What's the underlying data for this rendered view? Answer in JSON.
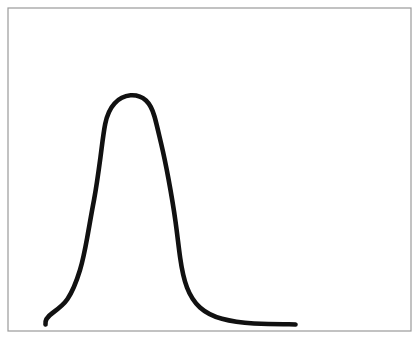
{
  "figure": {
    "title": "",
    "background_color": "#ffffff",
    "width": 418,
    "height": 340,
    "frame": {
      "name": "plot-frame-border",
      "x": 8,
      "y": 8,
      "width": 403,
      "height": 323,
      "stroke_color": "#9a9a9a",
      "stroke_width": 1.2,
      "fill_color": "#ffffff"
    },
    "curve": {
      "name": "hand-drawn-distribution-curve",
      "stroke_color": "#111111",
      "stroke_width": 4.6,
      "style": "hand-drawn",
      "path": "M 45.5 324.5 C 45.0 321.0 47.5 316.5 52.5 313.0 C 58.0 309.0 63.5 305.0 67.5 299.0 C 72.5 291.5 76.5 281.5 80.0 270.0 C 83.5 258.5 85.5 247.0 87.5 236.0 C 89.5 225.0 91.5 213.0 94.0 200.0 C 96.5 186.5 98.5 172.0 100.5 157.0 C 102.2 144.0 103.4 133.0 105.2 124.0 C 107.0 115.0 110.0 108.5 114.5 103.5 C 119.0 98.5 124.5 95.8 130.5 95.3 C 136.5 94.9 142.0 96.8 146.0 100.5 C 150.0 104.2 152.5 109.5 154.5 116.5 C 156.5 123.5 158.5 132.5 161.0 143.0 C 163.5 153.5 166.0 165.5 168.5 179.0 C 171.0 192.5 173.5 207.0 175.5 221.5 C 177.3 234.5 178.6 246.5 180.2 258.0 C 181.8 269.5 183.8 279.0 187.0 287.5 C 190.2 296.0 194.5 302.5 200.0 307.5 C 206.0 312.9 213.5 316.5 222.0 318.8 C 231.5 321.4 242.5 322.8 254.0 323.5 C 265.5 324.2 277.5 324.4 289.0 324.3 C 292.0 324.3 294.0 324.4 295.5 324.5"
    },
    "curve_shape": {
      "description": "unimodal right-skewed peak with long flat right tail and short rising left tail",
      "peak_x": 133,
      "peak_y": 96,
      "left_tail_start_x": 45,
      "left_tail_start_y": 324,
      "right_tail_end_x": 295,
      "right_tail_end_y": 324
    }
  },
  "chart_data": {
    "type": "line",
    "title": "",
    "subtitle": "",
    "xlabel": "",
    "ylabel": "",
    "grid": false,
    "legend": null,
    "axis_ticks": [],
    "tick_labels": [],
    "annotations": [],
    "series": [
      {
        "name": "hand-drawn curve",
        "color": "#111111",
        "x": [
          45,
          52,
          60,
          68,
          76,
          84,
          92,
          100,
          106,
          112,
          120,
          128,
          133,
          140,
          147,
          153,
          159,
          165,
          171,
          177,
          182,
          187,
          194,
          202,
          212,
          224,
          238,
          254,
          270,
          285,
          295
        ],
        "y": [
          324,
          313,
          308,
          298,
          284,
          265,
          246,
          224,
          200,
          172,
          140,
          112,
          96,
          96,
          101,
          113,
          131,
          153,
          178,
          202,
          228,
          252,
          276,
          296,
          310,
          318,
          322,
          323,
          324,
          324,
          324
        ]
      }
    ],
    "xlim": [
      8,
      411
    ],
    "ylim": [
      331,
      8
    ]
  }
}
